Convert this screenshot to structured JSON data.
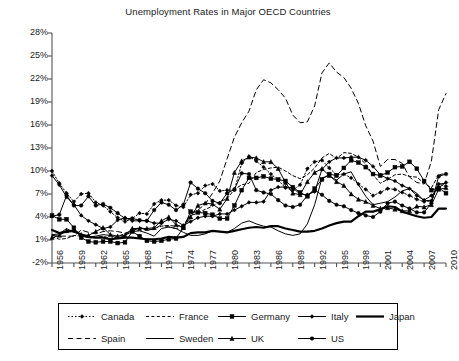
{
  "chart_data": {
    "type": "line",
    "title": "Unemployment Rates in Major OECD Countries",
    "xlabel": "",
    "ylabel": "",
    "ylim": [
      -2,
      28
    ],
    "yticks": [
      "-2%",
      "1%",
      "4%",
      "7%",
      "10%",
      "13%",
      "16%",
      "19%",
      "22%",
      "25%",
      "28%"
    ],
    "ytick_values": [
      -2,
      1,
      4,
      7,
      10,
      13,
      16,
      19,
      22,
      25,
      28
    ],
    "xlim": [
      1956,
      2010
    ],
    "xticks": [
      "1956",
      "1959",
      "1962",
      "1965",
      "1968",
      "1971",
      "1974",
      "1977",
      "1980",
      "1983",
      "1986",
      "1989",
      "1992",
      "1995",
      "1998",
      "2001",
      "2004",
      "2007",
      "2010"
    ],
    "xtick_values": [
      1956,
      1959,
      1962,
      1965,
      1968,
      1971,
      1974,
      1977,
      1980,
      1983,
      1986,
      1989,
      1992,
      1995,
      1998,
      2001,
      2004,
      2007,
      2010
    ],
    "grid": false,
    "legend_position": "below",
    "x": [
      1956,
      1957,
      1958,
      1959,
      1960,
      1961,
      1962,
      1963,
      1964,
      1965,
      1966,
      1967,
      1968,
      1969,
      1970,
      1971,
      1972,
      1973,
      1974,
      1975,
      1976,
      1977,
      1978,
      1979,
      1980,
      1981,
      1982,
      1983,
      1984,
      1985,
      1986,
      1987,
      1988,
      1989,
      1990,
      1991,
      1992,
      1993,
      1994,
      1995,
      1996,
      1997,
      1998,
      1999,
      2000,
      2001,
      2002,
      2003,
      2004,
      2005,
      2006,
      2007,
      2008,
      2009,
      2010
    ],
    "series": [
      {
        "name": "Canada",
        "style": "dotted",
        "marker": "diamond",
        "width": 1,
        "values": [
          10.0,
          8.4,
          7.1,
          6.0,
          7.0,
          7.1,
          5.9,
          5.5,
          4.7,
          3.9,
          3.4,
          3.8,
          4.5,
          4.4,
          5.7,
          6.2,
          6.2,
          5.5,
          5.3,
          6.9,
          7.1,
          8.1,
          8.3,
          7.4,
          7.5,
          7.5,
          11.0,
          11.9,
          11.3,
          10.5,
          9.6,
          8.8,
          7.8,
          7.5,
          8.2,
          10.3,
          11.2,
          11.4,
          10.4,
          9.5,
          9.6,
          9.1,
          8.3,
          7.6,
          6.8,
          7.2,
          7.7,
          7.6,
          7.2,
          6.8,
          6.3,
          6.0,
          6.1,
          8.3,
          8.0
        ]
      },
      {
        "name": "France",
        "style": "dashed",
        "marker": "none",
        "width": 1,
        "values": [
          1.4,
          1.1,
          1.2,
          1.6,
          1.5,
          1.3,
          1.3,
          1.5,
          1.2,
          1.5,
          1.8,
          2.1,
          2.7,
          2.3,
          2.5,
          2.8,
          2.9,
          2.8,
          2.9,
          4.2,
          4.5,
          5.0,
          5.4,
          6.0,
          6.4,
          7.6,
          8.2,
          8.4,
          9.8,
          10.2,
          10.4,
          10.5,
          10.0,
          9.4,
          9.0,
          9.5,
          10.4,
          11.7,
          12.3,
          11.6,
          12.4,
          12.3,
          11.8,
          10.9,
          9.5,
          8.4,
          8.9,
          9.5,
          9.6,
          9.3,
          9.2,
          8.4,
          7.8,
          9.5,
          9.7
        ]
      },
      {
        "name": "Germany",
        "style": "solid",
        "marker": "square",
        "width": 1,
        "values": [
          4.2,
          3.7,
          3.7,
          2.6,
          1.3,
          0.8,
          0.7,
          0.8,
          0.8,
          0.6,
          0.7,
          2.1,
          1.5,
          0.9,
          0.8,
          0.9,
          1.1,
          1.2,
          2.6,
          4.7,
          4.6,
          4.5,
          4.3,
          3.8,
          3.8,
          5.5,
          7.5,
          9.1,
          9.1,
          9.3,
          9.0,
          8.9,
          8.7,
          7.9,
          7.2,
          6.7,
          7.7,
          8.9,
          9.6,
          9.4,
          10.4,
          11.4,
          11.1,
          10.5,
          9.6,
          9.4,
          9.8,
          10.5,
          10.6,
          11.2,
          10.3,
          8.7,
          7.5,
          7.8,
          7.1
        ]
      },
      {
        "name": "Italy",
        "style": "solid",
        "marker": "diamond",
        "width": 1,
        "values": [
          9.4,
          8.2,
          6.6,
          5.6,
          4.2,
          3.5,
          3.0,
          2.5,
          2.7,
          3.6,
          3.9,
          3.5,
          3.5,
          3.5,
          3.2,
          3.2,
          3.7,
          3.5,
          2.9,
          3.4,
          3.9,
          4.1,
          4.1,
          4.4,
          4.4,
          4.9,
          5.4,
          5.9,
          5.9,
          6.0,
          7.5,
          7.9,
          7.9,
          7.8,
          7.0,
          6.9,
          7.3,
          10.2,
          11.2,
          11.7,
          11.7,
          11.8,
          11.8,
          11.4,
          10.6,
          9.5,
          9.0,
          8.7,
          8.1,
          7.7,
          6.8,
          6.2,
          6.8,
          7.8,
          8.5
        ]
      },
      {
        "name": "Japan",
        "style": "solid",
        "marker": "none",
        "width": 2.2,
        "values": [
          2.3,
          1.9,
          2.1,
          2.2,
          1.7,
          1.4,
          1.3,
          1.3,
          1.1,
          1.2,
          1.3,
          1.3,
          1.2,
          1.1,
          1.1,
          1.2,
          1.4,
          1.3,
          1.4,
          1.9,
          2.0,
          2.0,
          2.2,
          2.1,
          2.0,
          2.2,
          2.4,
          2.6,
          2.7,
          2.6,
          2.8,
          2.8,
          2.5,
          2.3,
          2.1,
          2.1,
          2.2,
          2.5,
          2.9,
          3.2,
          3.4,
          3.4,
          4.1,
          4.7,
          4.7,
          5.0,
          5.4,
          5.3,
          4.7,
          4.4,
          4.1,
          3.9,
          4.0,
          5.1,
          5.1
        ]
      },
      {
        "name": "Spain",
        "style": "longdash",
        "marker": "none",
        "width": 1,
        "values": [
          1.6,
          1.5,
          1.5,
          1.5,
          2.3,
          2.0,
          1.8,
          2.1,
          2.2,
          2.1,
          1.9,
          2.2,
          2.6,
          2.3,
          2.4,
          3.0,
          2.7,
          2.5,
          2.7,
          4.4,
          4.9,
          5.7,
          7.1,
          8.7,
          11.6,
          14.4,
          16.3,
          17.8,
          20.6,
          21.9,
          21.5,
          20.6,
          19.5,
          17.3,
          16.3,
          16.4,
          18.5,
          22.8,
          24.1,
          22.9,
          22.2,
          20.8,
          18.8,
          15.9,
          13.9,
          10.6,
          11.5,
          11.5,
          11.0,
          9.2,
          8.5,
          8.3,
          11.3,
          18.0,
          20.1
        ]
      },
      {
        "name": "Sweden",
        "style": "solid",
        "marker": "none",
        "width": 1,
        "values": [
          1.7,
          1.8,
          2.5,
          2.0,
          1.7,
          1.4,
          1.5,
          1.7,
          1.6,
          1.2,
          1.6,
          2.1,
          2.2,
          1.9,
          1.5,
          2.5,
          2.7,
          2.5,
          2.0,
          1.6,
          1.6,
          1.8,
          2.2,
          2.1,
          2.0,
          2.5,
          3.2,
          3.5,
          3.1,
          2.8,
          2.7,
          2.2,
          1.8,
          1.6,
          1.8,
          3.1,
          5.6,
          9.1,
          9.4,
          8.8,
          9.6,
          9.9,
          8.2,
          6.7,
          5.6,
          5.8,
          6.0,
          6.6,
          7.4,
          7.7,
          7.1,
          6.1,
          6.2,
          8.3,
          8.4
        ]
      },
      {
        "name": "UK",
        "style": "solid",
        "marker": "triangle",
        "width": 1,
        "values": [
          1.3,
          1.6,
          2.2,
          2.3,
          1.7,
          1.6,
          2.1,
          2.6,
          1.7,
          1.5,
          1.6,
          2.5,
          2.5,
          2.5,
          2.6,
          3.5,
          4.0,
          3.0,
          2.6,
          4.0,
          5.5,
          5.8,
          5.7,
          5.0,
          6.4,
          9.8,
          11.3,
          11.8,
          11.7,
          11.2,
          11.2,
          10.3,
          8.5,
          7.1,
          6.9,
          8.6,
          9.8,
          10.3,
          9.4,
          8.6,
          8.1,
          7.0,
          6.3,
          6.0,
          5.5,
          5.1,
          5.2,
          5.0,
          4.8,
          4.8,
          5.4,
          5.3,
          5.6,
          7.6,
          7.8
        ]
      },
      {
        "name": "US",
        "style": "solid",
        "marker": "circle",
        "width": 1,
        "values": [
          4.1,
          4.3,
          6.8,
          5.5,
          5.5,
          6.7,
          5.5,
          5.7,
          5.2,
          4.5,
          3.8,
          3.8,
          3.6,
          3.5,
          4.9,
          5.9,
          5.6,
          4.9,
          5.6,
          8.5,
          7.7,
          7.1,
          6.1,
          5.8,
          7.1,
          7.6,
          9.7,
          9.6,
          7.5,
          7.2,
          7.0,
          6.2,
          5.5,
          5.3,
          5.6,
          6.8,
          7.5,
          6.9,
          6.1,
          5.6,
          5.4,
          4.9,
          4.5,
          4.2,
          4.0,
          4.7,
          5.8,
          6.0,
          5.5,
          5.1,
          4.6,
          4.6,
          5.8,
          9.3,
          9.6
        ]
      }
    ]
  },
  "legend": {
    "rows": [
      [
        "Canada",
        "France",
        "Germany",
        "Italy",
        "Japan"
      ],
      [
        "Spain",
        "Sweden",
        "UK",
        "US"
      ]
    ]
  }
}
